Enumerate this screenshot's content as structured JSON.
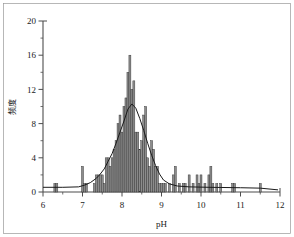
{
  "chart_data": {
    "type": "bar",
    "title": "",
    "xlabel": "pH",
    "ylabel": "频度",
    "xlim": [
      6,
      12
    ],
    "ylim": [
      0,
      20
    ],
    "grid": false,
    "legend": null,
    "xticks": [
      6,
      7,
      8,
      9,
      10,
      11,
      12
    ],
    "xtick_labels": [
      "6",
      "7",
      "8",
      "9",
      "10",
      "11",
      "12"
    ],
    "xminor_ticks": [
      6.5,
      7.5,
      8.5,
      9.5,
      10.5,
      11.5
    ],
    "yticks": [
      0,
      4,
      8,
      12,
      16,
      20
    ],
    "ytick_labels": [
      "0",
      "4",
      "8",
      "12",
      "16",
      "20"
    ],
    "yminor_ticks": [
      2,
      6,
      10,
      14,
      18
    ],
    "bar_width": 0.05,
    "bar_color": "#8c8c8c",
    "bar_edge_color": "#333333",
    "curve_color": "#1a1a1a",
    "axis_color": "#4d4d4d",
    "categories": [
      6.3,
      6.35,
      7.0,
      7.05,
      7.1,
      7.3,
      7.35,
      7.4,
      7.45,
      7.5,
      7.55,
      7.6,
      7.65,
      7.7,
      7.75,
      7.8,
      7.85,
      7.9,
      7.95,
      8.0,
      8.05,
      8.1,
      8.15,
      8.2,
      8.25,
      8.3,
      8.35,
      8.4,
      8.45,
      8.5,
      8.55,
      8.6,
      8.65,
      8.7,
      8.75,
      8.8,
      8.85,
      8.9,
      8.95,
      9.0,
      9.05,
      9.1,
      9.2,
      9.3,
      9.35,
      9.45,
      9.55,
      9.6,
      9.7,
      9.8,
      9.9,
      9.95,
      10.0,
      10.1,
      10.2,
      10.25,
      10.3,
      10.4,
      10.5,
      10.8,
      10.85,
      11.5
    ],
    "values": [
      1,
      1,
      3,
      1,
      1,
      1,
      2,
      2,
      2,
      2,
      1,
      4,
      4,
      3,
      4,
      5,
      6,
      8,
      9,
      7,
      10,
      11,
      14,
      16,
      12,
      13,
      7,
      7,
      5,
      6,
      9,
      10,
      4,
      3,
      6,
      5,
      3,
      3,
      1,
      1,
      1,
      1,
      1,
      2,
      3,
      1,
      1,
      1,
      2,
      1,
      2,
      1,
      2,
      1,
      2,
      3,
      1,
      1,
      1,
      1,
      1,
      1
    ],
    "curve_points": [
      {
        "x": 6.0,
        "y": 0.55
      },
      {
        "x": 6.5,
        "y": 0.55
      },
      {
        "x": 6.9,
        "y": 0.6
      },
      {
        "x": 7.05,
        "y": 0.8
      },
      {
        "x": 7.2,
        "y": 1.1
      },
      {
        "x": 7.35,
        "y": 1.6
      },
      {
        "x": 7.45,
        "y": 2.1
      },
      {
        "x": 7.55,
        "y": 2.7
      },
      {
        "x": 7.65,
        "y": 3.6
      },
      {
        "x": 7.75,
        "y": 4.5
      },
      {
        "x": 7.85,
        "y": 5.7
      },
      {
        "x": 7.95,
        "y": 7.0
      },
      {
        "x": 8.05,
        "y": 8.3
      },
      {
        "x": 8.15,
        "y": 9.7
      },
      {
        "x": 8.25,
        "y": 10.3
      },
      {
        "x": 8.35,
        "y": 9.8
      },
      {
        "x": 8.45,
        "y": 8.6
      },
      {
        "x": 8.55,
        "y": 7.2
      },
      {
        "x": 8.65,
        "y": 5.7
      },
      {
        "x": 8.75,
        "y": 4.3
      },
      {
        "x": 8.85,
        "y": 3.1
      },
      {
        "x": 8.95,
        "y": 2.1
      },
      {
        "x": 9.05,
        "y": 1.4
      },
      {
        "x": 9.2,
        "y": 0.95
      },
      {
        "x": 9.4,
        "y": 0.7
      },
      {
        "x": 9.7,
        "y": 0.6
      },
      {
        "x": 10.2,
        "y": 0.55
      },
      {
        "x": 11.0,
        "y": 0.5
      },
      {
        "x": 11.5,
        "y": 0.45
      },
      {
        "x": 11.95,
        "y": 0.25
      }
    ]
  }
}
